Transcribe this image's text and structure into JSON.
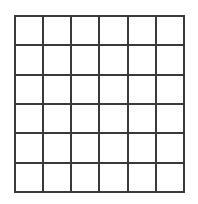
{
  "figure": {
    "kind": "empty-grid-diagram",
    "title": "",
    "caption": "",
    "cell_text": ""
  },
  "canvas": {
    "width": 198,
    "height": 204,
    "background_color": "#ffffff"
  },
  "grid": {
    "rows": 6,
    "columns": 6,
    "total_cells": 36,
    "origin_x": 14,
    "origin_y": 15,
    "width": 171,
    "height": 178,
    "cell_width": 28.5,
    "cell_height": 29.67,
    "line_color": "#3a3a3a",
    "line_width": 2,
    "cell_fill_color": "#ffffff",
    "cells": [
      [
        "",
        "",
        "",
        "",
        "",
        ""
      ],
      [
        "",
        "",
        "",
        "",
        "",
        ""
      ],
      [
        "",
        "",
        "",
        "",
        "",
        ""
      ],
      [
        "",
        "",
        "",
        "",
        "",
        ""
      ],
      [
        "",
        "",
        "",
        "",
        "",
        ""
      ],
      [
        "",
        "",
        "",
        "",
        "",
        ""
      ]
    ]
  }
}
